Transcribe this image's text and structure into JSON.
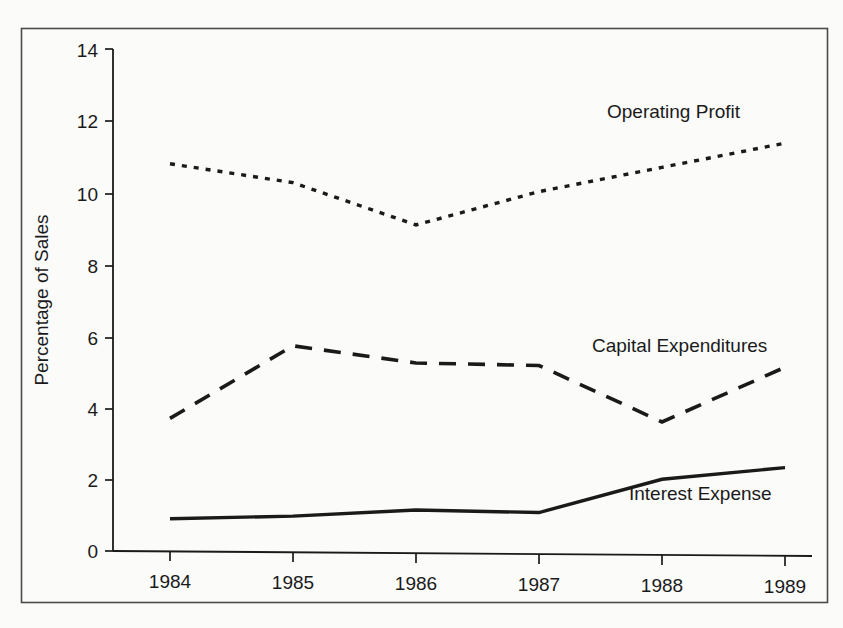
{
  "chart_data": {
    "type": "line",
    "title": "",
    "xlabel": "",
    "ylabel": "Percentage of Sales",
    "categories": [
      "1984",
      "1985",
      "1986",
      "1987",
      "1988",
      "1989"
    ],
    "x": [
      1984,
      1985,
      1986,
      1987,
      1988,
      1989
    ],
    "ylim": [
      0,
      14
    ],
    "xlim": [
      1983.6,
      1989.5
    ],
    "yticks": [
      "0",
      "2",
      "4",
      "6",
      "8",
      "10",
      "12",
      "14"
    ],
    "ytick_values": [
      0,
      2,
      4,
      6,
      8,
      10,
      12,
      14
    ],
    "grid": false,
    "legend_position": "inline-right-of-series",
    "series": [
      {
        "name": "Operating Profit",
        "style": "dotted",
        "color": "#1a1a1a",
        "values": [
          10.8,
          10.3,
          9.15,
          10.1,
          10.8,
          11.5
        ]
      },
      {
        "name": "Capital Expenditures",
        "style": "dashed",
        "color": "#1a1a1a",
        "values": [
          3.7,
          5.75,
          5.3,
          5.25,
          3.7,
          5.25
        ]
      },
      {
        "name": "Interest Expense",
        "style": "solid",
        "color": "#1a1a1a",
        "values": [
          0.9,
          1.0,
          1.2,
          1.15,
          2.1,
          2.45
        ]
      }
    ]
  },
  "frame": {
    "border_color": "#4a4a4a",
    "background": "#fbfbfa"
  }
}
